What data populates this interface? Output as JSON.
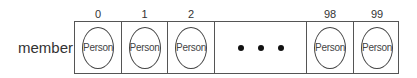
{
  "array_name": "member",
  "cells": [
    {
      "index": "0",
      "content": "Person",
      "left": 0,
      "width": 47
    },
    {
      "index": "1",
      "content": "Person",
      "left": 47,
      "width": 46
    },
    {
      "index": "2",
      "content": "Person",
      "left": 93,
      "width": 47
    },
    {
      "index": "",
      "content": "ellipsis",
      "left": 140,
      "width": 92
    },
    {
      "index": "98",
      "content": "Person",
      "left": 232,
      "width": 47
    },
    {
      "index": "99",
      "content": "Person",
      "left": 279,
      "width": 46
    }
  ],
  "ellipsis_count": 3
}
